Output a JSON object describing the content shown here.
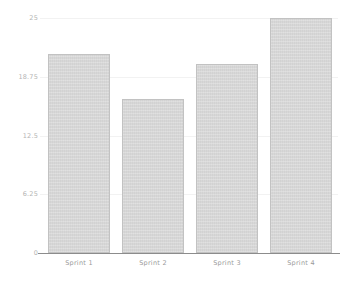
{
  "chart_data": {
    "type": "bar",
    "title": "",
    "subtitle": "",
    "xlabel": "",
    "ylabel": "",
    "categories": [
      "Sprint 1",
      "Sprint 2",
      "Sprint 3",
      "Sprint 4"
    ],
    "values": [
      21.2,
      16.4,
      20.1,
      25
    ],
    "ylim": [
      0,
      25
    ],
    "yticks": [
      0,
      6.25,
      12.5,
      18.75,
      25
    ],
    "ytick_labels": [
      "0",
      "6.25",
      "12.5",
      "18.75",
      "25"
    ],
    "xtick_labels": [
      "Sprint 1",
      "Sprint 2",
      "Sprint 3",
      "Sprint 4"
    ],
    "grid": true,
    "legend": false,
    "legend_position": "none",
    "series": [
      {
        "name": "",
        "values": [
          21.2,
          16.4,
          20.1,
          25
        ]
      }
    ],
    "colors": {
      "bar_fill": "#d6d6d6",
      "bar_border": "#c2c2c2",
      "gridline": "#f2f2f2",
      "axis": "#8c8c8c",
      "tick_text": "#a8a8a8",
      "background": "#ffffff"
    }
  }
}
